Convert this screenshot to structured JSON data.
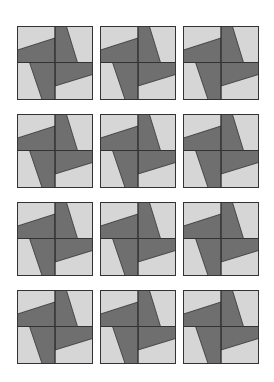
{
  "page": {
    "rows": 4,
    "cols": 3
  },
  "colors": {
    "background": "#ffffff",
    "light_fill": "#d6d6d6",
    "dark_fill": "#6f6f6f",
    "outline": "#333333"
  },
  "tiles": [
    {
      "row": 0,
      "col": 0,
      "x": 17,
      "y": 26
    },
    {
      "row": 0,
      "col": 1,
      "x": 100,
      "y": 26
    },
    {
      "row": 0,
      "col": 2,
      "x": 183,
      "y": 26
    },
    {
      "row": 1,
      "col": 0,
      "x": 17,
      "y": 114
    },
    {
      "row": 1,
      "col": 1,
      "x": 100,
      "y": 114
    },
    {
      "row": 1,
      "col": 2,
      "x": 183,
      "y": 114
    },
    {
      "row": 2,
      "col": 0,
      "x": 17,
      "y": 202
    },
    {
      "row": 2,
      "col": 1,
      "x": 100,
      "y": 202
    },
    {
      "row": 2,
      "col": 2,
      "x": 183,
      "y": 202
    },
    {
      "row": 3,
      "col": 0,
      "x": 17,
      "y": 290
    },
    {
      "row": 3,
      "col": 1,
      "x": 100,
      "y": 290
    },
    {
      "row": 3,
      "col": 2,
      "x": 183,
      "y": 290
    }
  ]
}
